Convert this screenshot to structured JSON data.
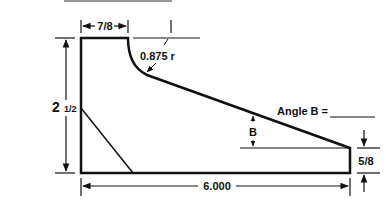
{
  "diagram": {
    "type": "technical-drawing",
    "colors": {
      "line": "#111111",
      "background": "#ffffff",
      "top_bar": "#9a9a9a"
    },
    "labels": {
      "top_width": "7/8",
      "radius": "0.875 r",
      "height_whole": "2",
      "height_fraction": "1/2",
      "angle_label": "Angle B =",
      "angle_answer": "",
      "angle_marker": "B",
      "right_height": "5/8",
      "base_width": "6.000"
    }
  }
}
